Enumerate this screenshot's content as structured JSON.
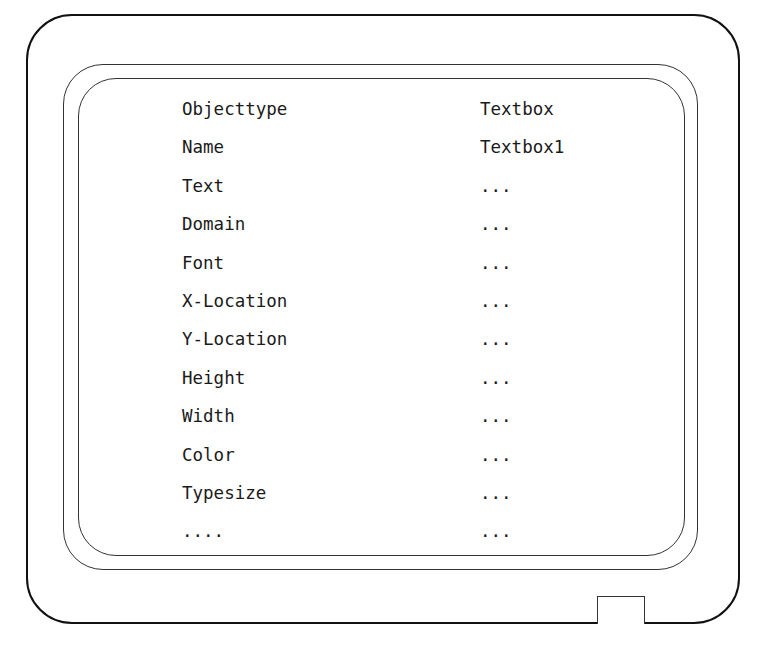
{
  "diagram": {
    "title": "",
    "properties": [
      {
        "label": "Objecttype",
        "value": "Textbox"
      },
      {
        "label": "Name",
        "value": "Textbox1"
      },
      {
        "label": "Text",
        "value": "..."
      },
      {
        "label": "Domain",
        "value": "..."
      },
      {
        "label": "Font",
        "value": "..."
      },
      {
        "label": "X-Location",
        "value": "..."
      },
      {
        "label": "Y-Location",
        "value": "..."
      },
      {
        "label": "Height",
        "value": "..."
      },
      {
        "label": "Width",
        "value": "..."
      },
      {
        "label": "Color",
        "value": "..."
      },
      {
        "label": "Typesize",
        "value": "..."
      },
      {
        "label": "....",
        "value": "..."
      }
    ]
  }
}
